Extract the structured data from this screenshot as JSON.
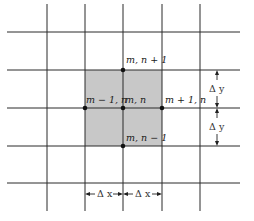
{
  "diagram": {
    "type": "finite-difference-grid",
    "colors": {
      "background": "#ffffff",
      "grid_line": "#2a2a2a",
      "shaded_cell": "#c8c8c8",
      "node": "#111111"
    },
    "nodes": [
      {
        "id": "center",
        "label": "m, n"
      },
      {
        "id": "top",
        "label": "m, n + 1"
      },
      {
        "id": "bottom",
        "label": "m, n − 1"
      },
      {
        "id": "left",
        "label": "m − 1, n"
      },
      {
        "id": "right",
        "label": "m + 1, n"
      }
    ],
    "dimensions": {
      "dy_upper": "Δ y",
      "dy_lower": "Δ y",
      "dx_left": "Δ x",
      "dx_right": "Δ x"
    }
  }
}
